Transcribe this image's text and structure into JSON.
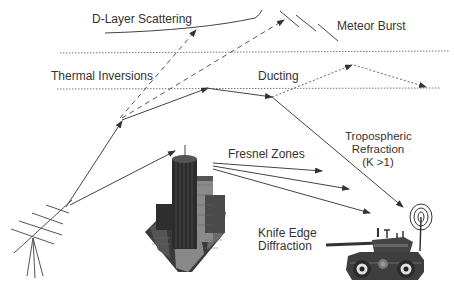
{
  "labels": {
    "d_layer": "D-Layer Scattering",
    "meteor": "Meteor Burst",
    "thermal": "Thermal Inversions",
    "ducting": "Ducting",
    "tropo_1": "Tropospheric",
    "tropo_2": "Refraction",
    "tropo_3": "(K >1)",
    "fresnel": "Fresnel Zones",
    "knife_1": "Knife Edge",
    "knife_2": "Diffraction"
  },
  "icons": {
    "antenna": "yagi-antenna-icon",
    "building": "skyscraper-icon",
    "vehicle": "armored-vehicle-icon"
  },
  "colors": {
    "line": "#444444",
    "text": "#333333",
    "dotted": "#777777"
  }
}
